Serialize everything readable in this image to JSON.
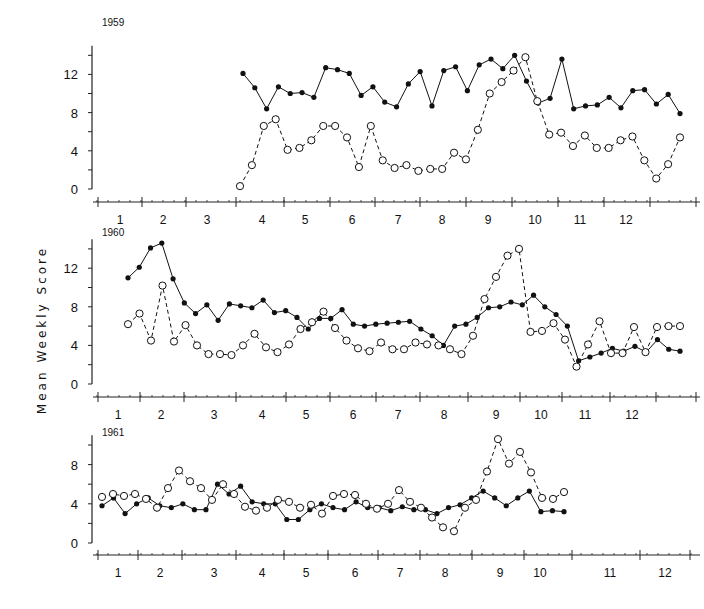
{
  "chart_data": {
    "type": "line",
    "ylabel": "Mean Weekly Score",
    "xlabel": "",
    "x_unit": "month (weekly points)",
    "month_ticks": [
      "1",
      "2",
      "3",
      "4",
      "5",
      "6",
      "7",
      "8",
      "9",
      "10",
      "11",
      "12"
    ],
    "legend": [
      {
        "name": "Series A",
        "marker": "filled-circle",
        "line": "solid"
      },
      {
        "name": "Series B",
        "marker": "open-circle",
        "line": "dashed"
      }
    ],
    "panels": [
      {
        "title": "1959",
        "yticks": [
          0,
          4,
          8,
          12
        ],
        "ylim": [
          0,
          15
        ],
        "series": [
          {
            "name": "Series A",
            "style": "solid-filled",
            "x": [
              3.7,
              3.95,
              4.2,
              4.45,
              4.7,
              4.95,
              5.2,
              5.45,
              5.7,
              5.95,
              6.2,
              6.45,
              6.7,
              6.95,
              7.2,
              7.45,
              7.7,
              7.95,
              8.2,
              8.45,
              8.7,
              8.95,
              9.2,
              9.45,
              9.7,
              9.95,
              10.2,
              10.45,
              10.7,
              10.95,
              11.2,
              11.45,
              11.95,
              12.2,
              12.45,
              12.95
            ],
            "values": [
              12.1,
              10.6,
              8.4,
              10.7,
              10.0,
              10.1,
              9.6,
              12.7,
              12.5,
              12.1,
              9.8,
              10.7,
              9.1,
              8.6,
              11.0,
              12.3,
              8.7,
              12.4,
              12.8,
              10.3,
              13.0,
              13.6,
              12.6,
              14.0,
              11.3,
              9.0,
              9.5,
              13.6,
              8.4,
              8.7,
              8.8,
              9.6,
              8.5,
              10.3,
              10.4,
              8.9,
              9.9,
              7.9
            ]
          },
          {
            "name": "Series B",
            "style": "dashed-open",
            "x": [
              3.7,
              3.95,
              4.2,
              4.45,
              4.7,
              4.95,
              5.2,
              5.45,
              5.7,
              5.95,
              6.2,
              6.45,
              6.7,
              6.95,
              7.2,
              7.45,
              7.7,
              7.95,
              8.2,
              8.45,
              8.7,
              8.95,
              9.2,
              9.45,
              9.7,
              9.95,
              10.2,
              10.45,
              10.7,
              10.95,
              11.2,
              11.45,
              11.95,
              12.2,
              12.45,
              12.95
            ],
            "values": [
              0.3,
              2.5,
              6.6,
              7.3,
              4.1,
              4.3,
              5.1,
              6.6,
              6.6,
              5.4,
              2.3,
              6.6,
              3.0,
              2.2,
              2.5,
              1.9,
              2.1,
              2.1,
              3.8,
              3.1,
              6.2,
              10.0,
              11.2,
              12.4,
              13.8,
              9.2,
              5.7,
              5.9,
              4.5,
              5.6,
              4.3,
              4.3,
              5.1,
              5.5,
              3.0,
              1.1,
              2.6,
              5.4
            ]
          }
        ]
      },
      {
        "title": "1960",
        "yticks": [
          0,
          4,
          8,
          12
        ],
        "ylim": [
          0,
          15
        ],
        "series": [
          {
            "name": "Series A",
            "style": "solid-filled",
            "values": [
              11.0,
              12.1,
              14.1,
              14.6,
              10.9,
              8.4,
              7.3,
              8.2,
              6.6,
              8.3,
              8.1,
              7.9,
              8.7,
              7.4,
              7.6,
              6.9,
              5.7,
              6.8,
              6.8,
              7.7,
              6.2,
              6.0,
              6.2,
              6.3,
              6.4,
              6.5,
              5.7,
              5.0,
              4.0,
              6.0,
              6.2,
              6.9,
              7.9,
              8.0,
              8.5,
              8.2,
              9.2,
              8.0,
              7.2,
              6.0,
              2.4,
              2.8,
              3.2,
              3.7,
              3.4,
              3.9,
              3.3,
              4.6,
              3.6,
              3.4
            ]
          },
          {
            "name": "Series B",
            "style": "dashed-open",
            "values": [
              6.2,
              7.3,
              4.5,
              10.2,
              4.4,
              6.1,
              4.0,
              3.1,
              3.1,
              3.0,
              4.0,
              5.2,
              3.8,
              3.3,
              4.1,
              5.7,
              6.4,
              7.5,
              5.8,
              4.5,
              3.7,
              3.4,
              4.3,
              3.6,
              3.6,
              4.3,
              4.1,
              4.0,
              3.6,
              3.1,
              5.0,
              8.8,
              11.1,
              13.3,
              14.0,
              5.4,
              5.5,
              6.3,
              4.6,
              1.8,
              4.1,
              6.5,
              3.2,
              3.2,
              5.9,
              3.3,
              5.9,
              6.0,
              6.0
            ]
          }
        ]
      },
      {
        "title": "1961",
        "yticks": [
          0,
          4,
          8
        ],
        "ylim": [
          0,
          11
        ],
        "series": [
          {
            "name": "Series A",
            "style": "solid-filled",
            "values": [
              3.8,
              4.6,
              3.0,
              4.0,
              4.6,
              3.8,
              3.6,
              4.0,
              3.4,
              3.4,
              6.0,
              5.0,
              5.8,
              4.2,
              4.0,
              4.0,
              2.4,
              2.4,
              3.4,
              4.0,
              3.6,
              3.4,
              4.2,
              3.6,
              3.6,
              3.3,
              3.7,
              3.4,
              3.4,
              3.0,
              3.6,
              3.9,
              4.6,
              5.3,
              4.6,
              3.8,
              4.6,
              5.3,
              3.2,
              3.3,
              3.2
            ]
          },
          {
            "name": "Series B",
            "style": "dashed-open",
            "values": [
              4.7,
              5.0,
              4.8,
              5.0,
              4.5,
              3.6,
              5.6,
              7.4,
              6.3,
              5.6,
              4.4,
              6.0,
              5.0,
              3.7,
              3.3,
              3.6,
              4.4,
              4.2,
              3.6,
              3.9,
              3.0,
              4.8,
              5.0,
              4.9,
              4.0,
              3.5,
              4.0,
              5.4,
              4.2,
              3.6,
              2.6,
              1.6,
              1.2,
              3.6,
              4.4,
              7.3,
              10.6,
              8.1,
              9.3,
              7.2,
              4.6,
              4.5,
              5.2
            ]
          }
        ]
      }
    ],
    "grid": false,
    "legend_position": "none"
  },
  "figure": {
    "ylabel": "Mean Weekly Score",
    "panel_titles": [
      "1959",
      "1960",
      "1961"
    ]
  }
}
